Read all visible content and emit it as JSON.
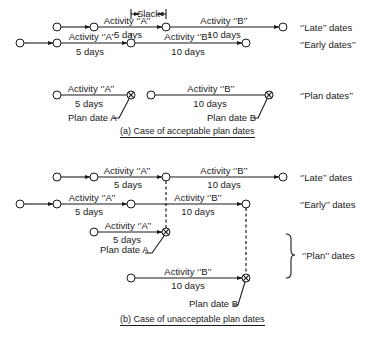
{
  "diagram": {
    "panel_a": {
      "caption": "(a)  Case of acceptable plan dates",
      "slack_label": "Slack",
      "rows": {
        "late": {
          "label": "‘’Late’’ dates",
          "act_a": "Activity ‘’A’’",
          "dur_a": "5 days",
          "act_b": "Activity ‘’B’’",
          "dur_b": "10 days"
        },
        "early": {
          "label": "‘’Early dates’’",
          "act_a": "Activity ‘’A’’",
          "dur_a": "5 days",
          "act_b": "Activity ‘’B’’",
          "dur_b": "10 days"
        },
        "plan": {
          "label": "‘’Plan dates’’",
          "act_a": "Activity ‘’A’’",
          "dur_a": "5 days",
          "act_b": "Activity ‘’B’’",
          "dur_b": "10 days",
          "plan_date_a": "Plan date A",
          "plan_date_b": "Plan date B"
        }
      }
    },
    "panel_b": {
      "caption": "(b)  Case of unacceptable plan dates",
      "rows": {
        "late": {
          "label": "‘’Late’’ dates",
          "act_a": "Activity ‘’A’’",
          "dur_a": "5 days",
          "act_b": "Activity ‘’B’’",
          "dur_b": "10 days"
        },
        "early": {
          "label": "‘’Early’’ dates",
          "act_a": "Activity ‘’A’’",
          "dur_a": "5 days",
          "act_b": "Activity ‘’B’’",
          "dur_b": "10 days"
        },
        "plan": {
          "label": "‘’Plan’’ dates",
          "act_a": "Activity ‘’A’’",
          "dur_a": "5 days",
          "act_b": "Activity ‘’B’’",
          "dur_b": "10 days",
          "plan_date_a": "Plan date A",
          "plan_date_b": "Plan date B"
        }
      }
    }
  }
}
